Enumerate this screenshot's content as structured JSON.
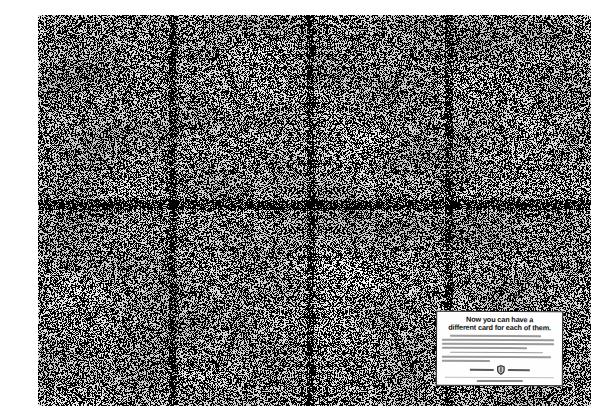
{
  "page": {
    "type": "print-advertisement",
    "background": "#ffffff"
  },
  "photo": {
    "subject": "dense black-and-white halftone photograph of a huge crowd of people filling the entire frame, with a few bird silhouettes",
    "ink_color": "#141414",
    "paper_color": "#ffffff"
  },
  "ad_box": {
    "headline": {
      "line1": "Now you can have a",
      "line2": "different card for each of them."
    },
    "fine_print": {
      "legible": false,
      "lines": [
        {
          "indent": 7,
          "width": 86,
          "gap": 0
        },
        {
          "indent": 0,
          "width": 97,
          "gap": 0
        },
        {
          "indent": 0,
          "width": 97,
          "gap": 0
        },
        {
          "indent": 0,
          "width": 74,
          "gap": 0
        },
        {
          "indent": 7,
          "width": 88,
          "gap": 1.5
        },
        {
          "indent": 0,
          "width": 95,
          "gap": 0
        },
        {
          "indent": 0,
          "width": 42,
          "gap": 0
        }
      ]
    },
    "logo_row": {
      "icon": "shield-crest",
      "left_word_width": 24,
      "right_word_width": 22
    },
    "tagline_width": 46
  }
}
